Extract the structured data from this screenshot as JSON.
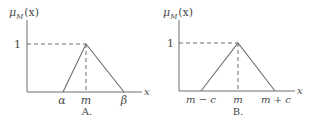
{
  "colors": {
    "line": "#6e6e6e",
    "text": "#4a4a4a",
    "background": "#ffffff"
  },
  "panels": [
    {
      "id": "A",
      "caption": "A.",
      "y_axis_label": {
        "main": "μ",
        "sub": "M",
        "arg": "(x)"
      },
      "x_axis_label": "x",
      "y_tick": "1",
      "x_ticks": [
        "α",
        "m",
        "β"
      ],
      "shape": {
        "type": "triangle",
        "left": "α",
        "peak": "m",
        "right": "β",
        "peak_value": 1,
        "symmetric": false
      }
    },
    {
      "id": "B",
      "caption": "B.",
      "y_axis_label": {
        "main": "μ",
        "sub": "M",
        "arg": "(x)"
      },
      "x_axis_label": "x",
      "y_tick": "1",
      "x_ticks": [
        "m − c",
        "m",
        "m + c"
      ],
      "shape": {
        "type": "triangle",
        "left": "m − c",
        "peak": "m",
        "right": "m + c",
        "peak_value": 1,
        "symmetric": true
      }
    }
  ]
}
